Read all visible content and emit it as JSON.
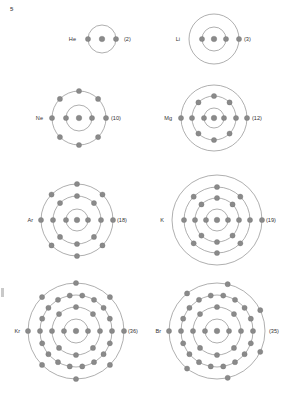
{
  "page": {
    "number": "5",
    "background_color": "#ffffff",
    "ink_color": "#8a8a8a",
    "ring_color": "#8d8d8d",
    "text_color": "#333333"
  },
  "diagram_title": "Bohr shell diagrams of atoms",
  "atoms": [
    {
      "id": "helium",
      "symbol": "He",
      "count_label": "(2)",
      "atomic_number": 2,
      "shells": [
        2
      ],
      "shell_radii": [
        14
      ],
      "cx": 102,
      "cy": 39,
      "label_dx": -26,
      "count_dx": 22
    },
    {
      "id": "lithium",
      "symbol": "Li",
      "count_label": "(3)",
      "atomic_number": 3,
      "shells": [
        2,
        1
      ],
      "shell_radii": [
        12,
        25
      ],
      "cx": 214,
      "cy": 39,
      "label_dx": -34,
      "count_dx": 30
    },
    {
      "id": "neon",
      "symbol": "Ne",
      "count_label": "(10)",
      "atomic_number": 10,
      "shells": [
        2,
        8
      ],
      "shell_radii": [
        13,
        27
      ],
      "cx": 79,
      "cy": 118,
      "label_dx": -36,
      "count_dx": 32
    },
    {
      "id": "magnesium",
      "symbol": "Mg",
      "count_label": "(12)",
      "atomic_number": 12,
      "shells": [
        2,
        8,
        2
      ],
      "shell_radii": [
        10,
        22,
        33
      ],
      "cx": 214,
      "cy": 118,
      "label_dx": -42,
      "count_dx": 38
    },
    {
      "id": "argon",
      "symbol": "Ar",
      "count_label": "(18)",
      "atomic_number": 18,
      "shells": [
        2,
        8,
        8
      ],
      "shell_radii": [
        11,
        24,
        36
      ],
      "cx": 77,
      "cy": 220,
      "label_dx": -44,
      "count_dx": 40
    },
    {
      "id": "potassium",
      "symbol": "K",
      "count_label": "(19)",
      "atomic_number": 19,
      "shells": [
        2,
        8,
        8,
        1
      ],
      "shell_radii": [
        11,
        22,
        33,
        45
      ],
      "cx": 217,
      "cy": 220,
      "label_dx": -53,
      "count_dx": 49
    },
    {
      "id": "krypton",
      "symbol": "Kr",
      "count_label": "(36)",
      "atomic_number": 36,
      "shells": [
        2,
        8,
        18,
        8
      ],
      "shell_radii": [
        12,
        24,
        36,
        48
      ],
      "cx": 76,
      "cy": 331,
      "label_dx": -56,
      "count_dx": 52
    },
    {
      "id": "bromine",
      "symbol": "Br",
      "count_label": "(35)",
      "atomic_number": 35,
      "shells": [
        2,
        8,
        18,
        7
      ],
      "shell_radii": [
        12,
        24,
        36,
        48
      ],
      "cx": 217,
      "cy": 331,
      "label_dx": -56,
      "count_dx": 52
    }
  ]
}
